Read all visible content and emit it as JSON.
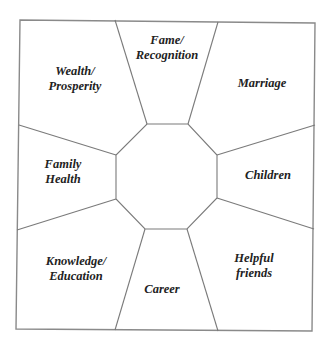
{
  "diagram": {
    "title": "",
    "colors": {
      "line": "#7a7a7a",
      "text": "#222222",
      "background": "#ffffff"
    },
    "regions": [
      {
        "id": "fame",
        "lines": [
          "Fame/",
          "Recognition"
        ],
        "position": "top"
      },
      {
        "id": "marriage",
        "lines": [
          "Marriage"
        ],
        "position": "top-right"
      },
      {
        "id": "children",
        "lines": [
          "Children"
        ],
        "position": "right"
      },
      {
        "id": "helpful",
        "lines": [
          "Helpful",
          "friends"
        ],
        "position": "bottom-right"
      },
      {
        "id": "career",
        "lines": [
          "Career"
        ],
        "position": "bottom"
      },
      {
        "id": "knowledge",
        "lines": [
          "Knowledge/",
          "Education"
        ],
        "position": "bottom-left"
      },
      {
        "id": "family",
        "lines": [
          "Family",
          "Health"
        ],
        "position": "left"
      },
      {
        "id": "wealth",
        "lines": [
          "Wealth/",
          "Prosperity"
        ],
        "position": "top-left"
      }
    ],
    "center": {
      "shape": "octagon",
      "label": ""
    }
  }
}
